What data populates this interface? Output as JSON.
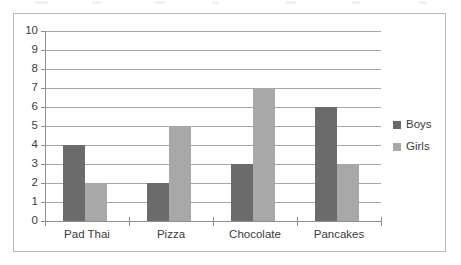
{
  "chart_data": {
    "type": "bar",
    "title": "",
    "subtitle": "",
    "xlabel": "",
    "ylabel": "",
    "categories": [
      "Pad Thai",
      "Pizza",
      "Chocolate",
      "Pancakes"
    ],
    "series": [
      {
        "name": "Boys",
        "values": [
          4,
          2,
          3,
          6
        ],
        "color": "#6b6b6b"
      },
      {
        "name": "Girls",
        "values": [
          2,
          5,
          7,
          3
        ],
        "color": "#a8a8a8"
      }
    ],
    "ylim": [
      0,
      10
    ],
    "y_ticks": [
      10,
      9,
      8,
      7,
      6,
      5,
      4,
      3,
      2,
      1,
      0
    ],
    "y_tick_labels": [
      "10",
      "9",
      "8",
      "7",
      "6",
      "5",
      "4",
      "3",
      "2",
      "1",
      "0"
    ],
    "grid": true,
    "grid_axis": "y",
    "legend_position": "right",
    "bar_group_mode": "grouped",
    "frame_border_color": "#b9b9b9",
    "gridline_color": "#a6a6a6",
    "axis_color": "#8f8f8f",
    "text_color": "#3b3b3b",
    "background": "#ffffff"
  },
  "legend": {
    "items": [
      {
        "label": "Boys",
        "color": "#6b6b6b"
      },
      {
        "label": "Girls",
        "color": "#a8a8a8"
      }
    ]
  }
}
